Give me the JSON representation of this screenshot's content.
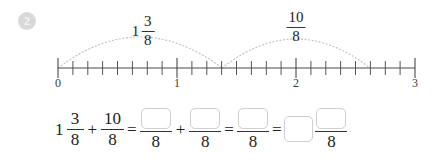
{
  "problem": {
    "number": "2"
  },
  "number_line": {
    "start": 0,
    "end": 3,
    "subdivisions_per_unit": 8,
    "major_tick_labels": [
      "0",
      "1",
      "2",
      "3"
    ],
    "jumps": [
      {
        "label_whole": "1",
        "label_numerator": "3",
        "label_denominator": "8",
        "from": 0,
        "to": 1.375
      },
      {
        "label_whole": "",
        "label_numerator": "10",
        "label_denominator": "8",
        "from": 1.375,
        "to": 2.625
      }
    ]
  },
  "equation": {
    "term1": {
      "whole": "1",
      "numerator": "3",
      "denominator": "8"
    },
    "op1": "+",
    "term2": {
      "numerator": "10",
      "denominator": "8"
    },
    "op2": "=",
    "term3": {
      "numerator": "",
      "denominator": "8"
    },
    "op3": "+",
    "term4": {
      "numerator": "",
      "denominator": "8"
    },
    "op4": "=",
    "term5": {
      "numerator": "",
      "denominator": "8"
    },
    "op5": "=",
    "term6": {
      "whole": "",
      "numerator": "",
      "denominator": "8"
    }
  },
  "colors": {
    "ink": "#222222",
    "badge_fill": "#d9d9d9",
    "badge_text": "#f2f2f2",
    "box_border": "#cfcfcf",
    "arc": "#bdbdbd",
    "axis": "#4a4a4a"
  }
}
